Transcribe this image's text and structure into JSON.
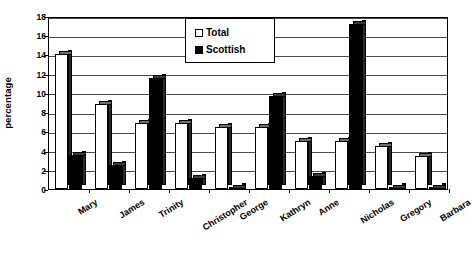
{
  "chart_data": {
    "type": "bar",
    "title": "",
    "xlabel": "",
    "ylabel": "percentage",
    "ylim": [
      0,
      18
    ],
    "ytick_step": 2,
    "yticks": [
      0,
      2,
      4,
      6,
      8,
      10,
      12,
      14,
      16,
      18
    ],
    "grid": true,
    "legend_position": "top-center",
    "categories": [
      "Mary",
      "James",
      "Trinity",
      "Christopher",
      "George",
      "Kathryn",
      "Anne",
      "Nicholas",
      "Gregory",
      "Barbara"
    ],
    "series": [
      {
        "name": "Total",
        "color": "#ffffff",
        "values": [
          14.0,
          8.8,
          6.9,
          6.9,
          6.5,
          6.5,
          5.0,
          5.0,
          4.5,
          3.4
        ]
      },
      {
        "name": "Scottish",
        "color": "#000000",
        "values": [
          3.5,
          2.5,
          11.6,
          1.1,
          0.1,
          9.7,
          1.4,
          17.2,
          0.1,
          0.1
        ]
      }
    ]
  },
  "legend": {
    "items": [
      {
        "label": "Total",
        "swatch": "total"
      },
      {
        "label": "Scottish",
        "swatch": "scottish"
      }
    ]
  },
  "axis": {
    "y_title": "percentage"
  }
}
